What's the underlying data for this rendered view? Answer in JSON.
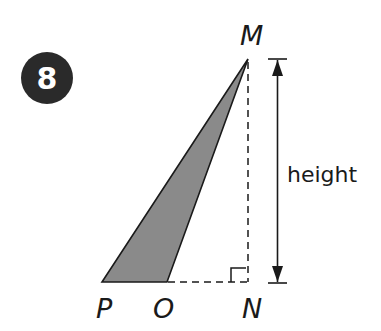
{
  "problem": {
    "number": "8"
  },
  "diagram": {
    "shape": "triangle",
    "vertices": {
      "M": "M",
      "P": "P",
      "O": "O",
      "N": "N"
    },
    "dimension_label": "height",
    "colors": {
      "fill": "#8a8a8a",
      "stroke": "#1a1a1a",
      "badge": "#2a2a2a"
    }
  }
}
